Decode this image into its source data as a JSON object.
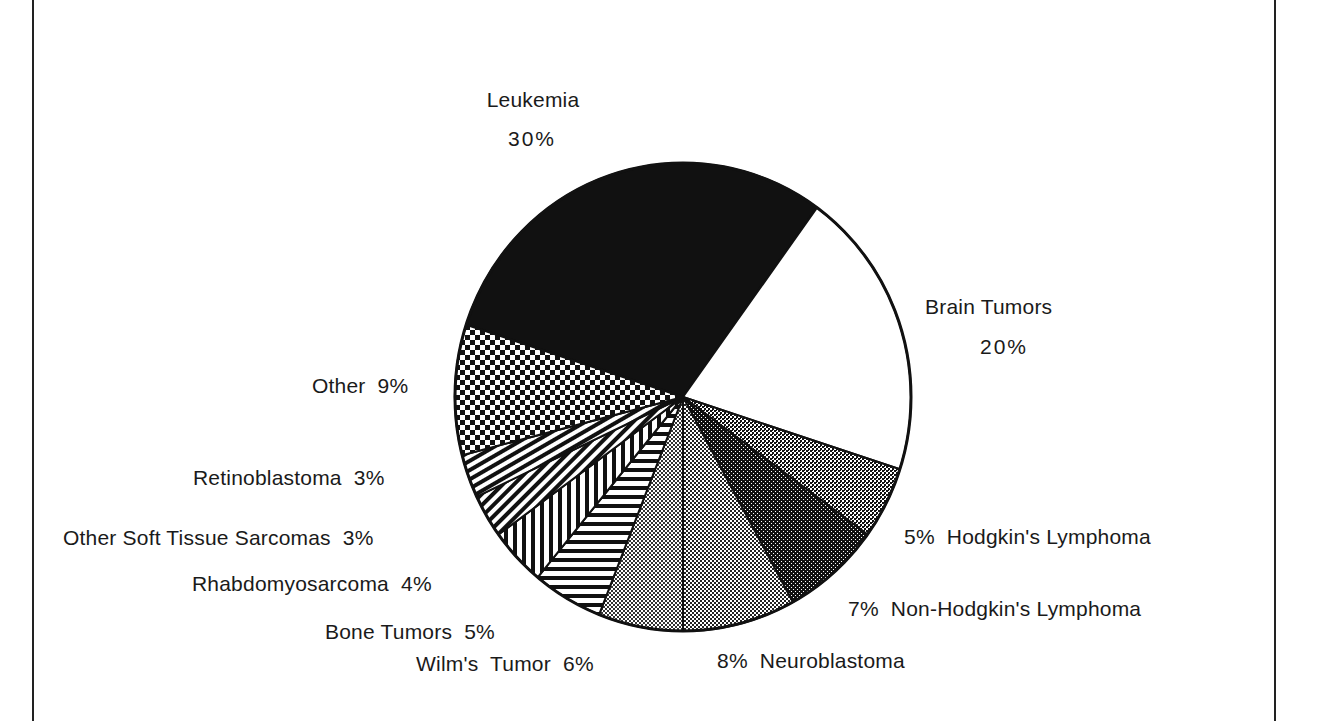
{
  "chart_data": {
    "type": "pie",
    "title": "",
    "start_boundary_deg": 180,
    "unit": "%",
    "slices": [
      {
        "label": "Leukemia",
        "value": 30,
        "fill": "solid-black"
      },
      {
        "label": "Brain Tumors",
        "value": 20,
        "fill": "white"
      },
      {
        "label": "Hodgkin's Lymphoma",
        "value": 5,
        "fill": "medium-dots"
      },
      {
        "label": "Non-Hodgkin's Lymphoma",
        "value": 7,
        "fill": "dark-dots"
      },
      {
        "label": "Neuroblastoma",
        "value": 8,
        "fill": "light-dots"
      },
      {
        "label": "Wilm's Tumor",
        "value": 6,
        "fill": "light-dots-2"
      },
      {
        "label": "Bone Tumors",
        "value": 5,
        "fill": "horizontal-lines"
      },
      {
        "label": "Rhabdomyosarcoma",
        "value": 4,
        "fill": "vertical-lines"
      },
      {
        "label": "Other Soft Tissue Sarcomas",
        "value": 3,
        "fill": "diagonal-back"
      },
      {
        "label": "Retinoblastoma",
        "value": 3,
        "fill": "diagonal-forward"
      },
      {
        "label": "Other",
        "value": 9,
        "fill": "checkerboard"
      }
    ],
    "categories": [
      "Leukemia",
      "Brain Tumors",
      "Hodgkin's Lymphoma",
      "Non-Hodgkin's Lymphoma",
      "Neuroblastoma",
      "Wilm's Tumor",
      "Bone Tumors",
      "Rhabdomyosarcoma",
      "Other Soft Tissue Sarcomas",
      "Retinoblastoma",
      "Other"
    ],
    "values": [
      30,
      20,
      5,
      7,
      8,
      6,
      5,
      4,
      3,
      3,
      9
    ]
  },
  "labels": {
    "leukemia_name": "Leukemia",
    "leukemia_pct": "30%",
    "brain_name": "Brain Tumors",
    "brain_pct": "20%",
    "hodgkin": "5%  Hodgkin's Lymphoma",
    "nonhodgkin": "7%  Non-Hodgkin's Lymphoma",
    "neuroblastoma": "8%  Neuroblastoma",
    "wilms": "Wilm's  Tumor  6%",
    "bone": "Bone Tumors  5%",
    "rhabdo": "Rhabdomyosarcoma  4%",
    "osts": "Other Soft Tissue Sarcomas  3%",
    "retino": "Retinoblastoma  3%",
    "other": "Other  9%"
  },
  "colors": {
    "ink": "#111111",
    "paper": "#ffffff"
  }
}
